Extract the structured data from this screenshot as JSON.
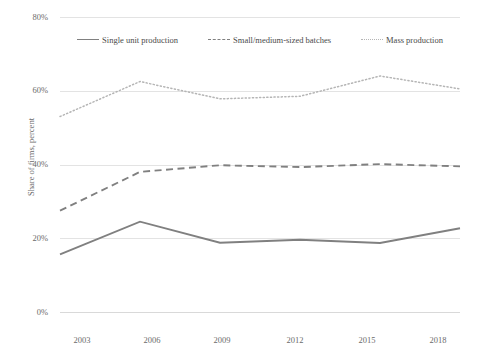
{
  "chart_data": {
    "type": "line",
    "title": "",
    "xlabel": "",
    "ylabel": "Share of firms, percent",
    "x": [
      2003,
      2006,
      2009,
      2012,
      2015,
      2018
    ],
    "categories": [
      "2003",
      "2006",
      "2009",
      "2012",
      "2015",
      "2018"
    ],
    "xlim": [
      2003,
      2018
    ],
    "ylim": [
      0,
      80
    ],
    "yticks": [
      "0%",
      "20%",
      "40%",
      "60%",
      "80%"
    ],
    "ytick_values": [
      0,
      20,
      40,
      60,
      80
    ],
    "grid": true,
    "legend_position": "top-center",
    "series": [
      {
        "name": "Single unit production",
        "style": "solid",
        "color": "#808080",
        "values": [
          15.6,
          24.5,
          18.8,
          19.6,
          18.7,
          22.7
        ]
      },
      {
        "name": "Small/medium-sized batches",
        "style": "dashed",
        "color": "#808080",
        "values": [
          27.5,
          38.0,
          39.8,
          39.3,
          40.1,
          39.5
        ]
      },
      {
        "name": "Mass production",
        "style": "dotted",
        "color": "#b5b5b5",
        "values": [
          53.0,
          62.5,
          57.8,
          58.5,
          64.0,
          60.5
        ]
      }
    ]
  },
  "axis": {
    "y_title": "Share of firms, percent",
    "y_ticks": [
      "80%",
      "60%",
      "40%",
      "20%",
      "0%"
    ],
    "x_ticks": [
      "2003",
      "2006",
      "2009",
      "2012",
      "2015",
      "2018"
    ]
  },
  "legend": {
    "items": [
      {
        "label": "Single unit production"
      },
      {
        "label": "Small/medium-sized batches"
      },
      {
        "label": "Mass production"
      }
    ]
  },
  "colors": {
    "series_solid": "#808080",
    "series_dashed": "#808080",
    "series_dotted": "#b5b5b5",
    "grid": "#e3e3e3",
    "text": "#6b6b6b"
  }
}
